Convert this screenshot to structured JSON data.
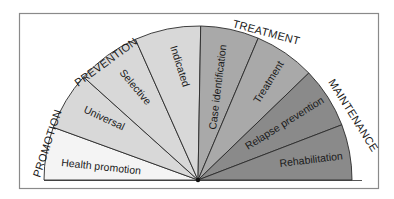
{
  "diagram": {
    "type": "semicircular-continuum",
    "categories": [
      {
        "label": "PROMOTION"
      },
      {
        "label": "PREVENTION"
      },
      {
        "label": "TREATMENT"
      },
      {
        "label": "MAINTENANCE"
      }
    ],
    "wedges": [
      {
        "label": "Health promotion",
        "category": "PROMOTION",
        "color": "#f4f4f4"
      },
      {
        "label": "Universal",
        "category": "PREVENTION",
        "color": "#d8d8d8"
      },
      {
        "label": "Selective",
        "category": "PREVENTION",
        "color": "#d8d8d8"
      },
      {
        "label": "Indicated",
        "category": "PREVENTION",
        "color": "#d8d8d8"
      },
      {
        "label": "Case identification",
        "category": "TREATMENT",
        "color": "#a9a9a9"
      },
      {
        "label": "Treatment",
        "category": "TREATMENT",
        "color": "#a9a9a9"
      },
      {
        "label": "Relapse prevention",
        "category": "MAINTENANCE",
        "color": "#8a8a8a"
      },
      {
        "label": "Rehabilitation",
        "category": "MAINTENANCE",
        "color": "#8a8a8a"
      }
    ]
  }
}
